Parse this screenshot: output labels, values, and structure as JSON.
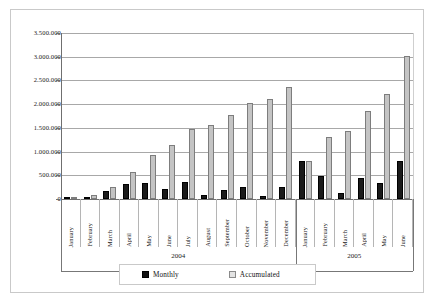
{
  "chart_data": {
    "type": "bar",
    "title": "",
    "subtitle": "",
    "xlabel": "",
    "ylabel": "",
    "ylim": [
      0,
      3500000
    ],
    "ytick_labels": [
      "3.500.000",
      "3.000.000",
      "2.500.000",
      "2.000.000",
      "1.500.000",
      "1.000.000",
      "500.000",
      "0"
    ],
    "ytick_values": [
      3500000,
      3000000,
      2500000,
      2000000,
      1500000,
      1000000,
      500000,
      0
    ],
    "grid": true,
    "legend_position": "bottom",
    "categories": [
      "January",
      "February",
      "March",
      "April",
      "May",
      "June",
      "July",
      "August",
      "September",
      "October",
      "November",
      "December",
      "January",
      "February",
      "March",
      "April",
      "May",
      "June"
    ],
    "group_labels": [
      "2004",
      "2005"
    ],
    "group_spans": [
      12,
      6
    ],
    "series": [
      {
        "name": "Monthly",
        "color": "#111111",
        "values": [
          40000,
          35000,
          160000,
          310000,
          340000,
          215000,
          350000,
          95000,
          190000,
          260000,
          60000,
          260000,
          805000,
          495000,
          125000,
          445000,
          345000,
          805000
        ]
      },
      {
        "name": "Accumulated",
        "color": "#c4c4c4",
        "values": [
          50000,
          95000,
          260000,
          575000,
          920000,
          1130000,
          1480000,
          1570000,
          1765000,
          2025000,
          2100000,
          2365000,
          805000,
          1300000,
          1425000,
          1865000,
          2215000,
          3010000
        ]
      }
    ]
  },
  "legend": {
    "monthly_label": "Monthly",
    "accumulated_label": "Accumulated"
  }
}
